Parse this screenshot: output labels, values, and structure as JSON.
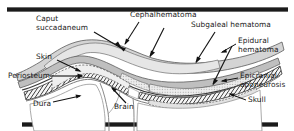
{
  "figure": {
    "title_text": "",
    "type": "anatomical cross-section",
    "colors": {
      "rule": "#1b1b1b",
      "background": "#ffffff",
      "label_text": "#1a1a1a",
      "scalp_fill": "#d9d9d9",
      "fluid_fill": "#efefef",
      "bone_fill": "#f4f4f4",
      "bone_hatch": "#2b2b2b",
      "aponeurosis": "#bdbdbd",
      "outline": "#5a5a5a",
      "brain_outline": "#8a8a8a"
    }
  },
  "labels": {
    "caput": "Caput\nsuccadaneum",
    "cephalhematoma": "Cephalhematoma",
    "subgaleal": "Subgaleal hematoma",
    "epidural": "Epidural\nhematoma",
    "epicranial": "Epicranial\naponeurosis",
    "skull": "Skull",
    "skin": "Skin",
    "periosteum": "Periosteum",
    "dura": "Dura",
    "brain": "Brain"
  }
}
